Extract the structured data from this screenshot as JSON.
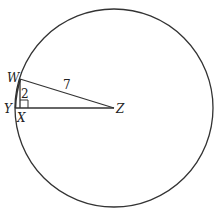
{
  "diagram": {
    "type": "geometry-circle",
    "circle": {
      "center_label": "Z",
      "cx": 114,
      "cy": 108,
      "r": 99
    },
    "points": {
      "W": {
        "label": "W",
        "x": 20,
        "y": 79
      },
      "X": {
        "label": "X",
        "x": 20,
        "y": 108
      },
      "Y": {
        "label": "Y",
        "x": 15,
        "y": 108
      },
      "Z": {
        "label": "Z",
        "x": 114,
        "y": 108
      }
    },
    "segments": [
      {
        "from": "W",
        "to": "Z",
        "length_label": "7"
      },
      {
        "from": "W",
        "to": "X",
        "length_label": "2"
      },
      {
        "from": "Y",
        "to": "Z",
        "length_label": ""
      }
    ],
    "right_angle_at": "X",
    "labels": {
      "W": "W",
      "X": "X",
      "Y": "Y",
      "Z": "Z",
      "WZ": "7",
      "WX": "2"
    },
    "colors": {
      "stroke": "#333333",
      "background": "#ffffff"
    }
  }
}
